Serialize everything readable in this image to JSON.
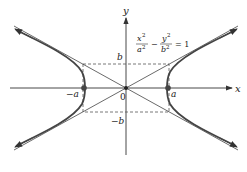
{
  "diagram": {
    "equation": {
      "x_num": "x",
      "x_exp": "2",
      "x_den": "a",
      "x_den_exp": "2",
      "minus": "−",
      "y_num": "y",
      "y_exp": "2",
      "y_den": "b",
      "y_den_exp": "2",
      "rhs": "= 1"
    },
    "axes": {
      "x_label": "x",
      "y_label": "y",
      "origin_label": "0"
    },
    "labels": {
      "a_pos": "a",
      "a_neg": "−a",
      "b_pos": "b",
      "b_neg": "−b"
    },
    "elements": [
      "hyperbola-right-branch",
      "hyperbola-left-branch",
      "asymptotes",
      "fundamental-rectangle (dashed)",
      "vertices (±a, 0)"
    ],
    "colors": {
      "curve": "#444444",
      "axis": "#333333",
      "dashed": "#555555"
    }
  }
}
